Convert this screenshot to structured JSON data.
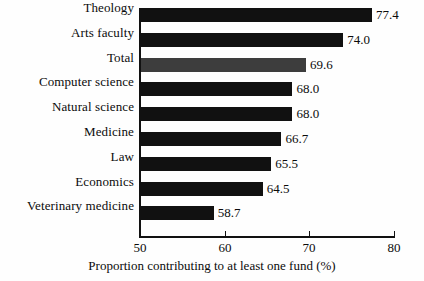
{
  "chart_data": {
    "type": "bar",
    "orientation": "horizontal",
    "title": "",
    "xlabel": "Proportion contributing to at least one fund (%)",
    "ylabel": "",
    "xlim": [
      50,
      80
    ],
    "xticks": [
      50,
      60,
      70,
      80
    ],
    "grid": false,
    "legend": null,
    "categories": [
      "Theology",
      "Arts faculty",
      "Total",
      "Computer science",
      "Natural science",
      "Medicine",
      "Law",
      "Economics",
      "Veterinary medicine"
    ],
    "values": [
      77.4,
      74.0,
      69.6,
      68.0,
      68.0,
      66.7,
      65.5,
      64.5,
      58.7
    ],
    "value_labels": [
      "77.4",
      "74.0",
      "69.6",
      "68.0",
      "68.0",
      "66.7",
      "65.5",
      "64.5",
      "58.7"
    ],
    "bar_colors": [
      "#111111",
      "#111111",
      "#3d3d3d",
      "#111111",
      "#111111",
      "#111111",
      "#111111",
      "#111111",
      "#111111"
    ]
  },
  "axis": {
    "tick_labels": [
      "50",
      "60",
      "70",
      "80"
    ],
    "title": "Proportion contributing to at least one fund (%)"
  },
  "colors": {
    "bar_default": "#111111",
    "bar_highlight": "#3d3d3d",
    "axis": "#111111",
    "background": "#fefefe",
    "text": "#0b0b0b"
  }
}
